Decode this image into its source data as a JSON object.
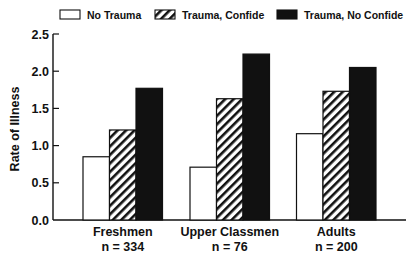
{
  "chart_data": {
    "type": "bar",
    "title": "",
    "xlabel": "",
    "ylabel": "Rate of Illness",
    "ylim": [
      0,
      2.5
    ],
    "yticks": [
      "0.0",
      "0.5",
      "1.0",
      "1.5",
      "2.0",
      "2.5"
    ],
    "grid": false,
    "legend_position": "top",
    "categories": [
      "Freshmen",
      "Upper Classmen",
      "Adults"
    ],
    "category_sublabels": [
      "n = 334",
      "n = 76",
      "n = 200"
    ],
    "series": [
      {
        "name": "No Trauma",
        "fill": "white",
        "values": [
          0.85,
          0.71,
          1.16
        ]
      },
      {
        "name": "Trauma, Confide",
        "fill": "hatched",
        "values": [
          1.21,
          1.63,
          1.73
        ]
      },
      {
        "name": "Trauma, No Confide",
        "fill": "black",
        "values": [
          1.77,
          2.23,
          2.05
        ]
      }
    ]
  },
  "colors": {
    "ink": "#111111",
    "background": "#ffffff"
  }
}
